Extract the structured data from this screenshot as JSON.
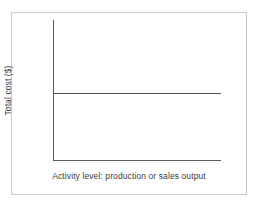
{
  "figure": {
    "frame_color": "#c9c9c9",
    "background": "#ffffff",
    "line_color": "#4e4e4e",
    "axis_color": "#5a5a5a",
    "text_color": "#3c3c3c"
  },
  "chart_data": {
    "type": "line",
    "title": "",
    "subtitle": "",
    "xlabel": "Activity level: production or sales output",
    "ylabel": "Total cost ($)",
    "xlim": [
      0,
      100
    ],
    "ylim": [
      0,
      100
    ],
    "xticks": [],
    "yticks": [],
    "xticklabels": [],
    "yticklabels": [],
    "grid": false,
    "legend": null,
    "annotations": [],
    "series": [
      {
        "name": "Total cost",
        "x": [
          0,
          100
        ],
        "values": [
          47,
          47
        ]
      }
    ]
  }
}
